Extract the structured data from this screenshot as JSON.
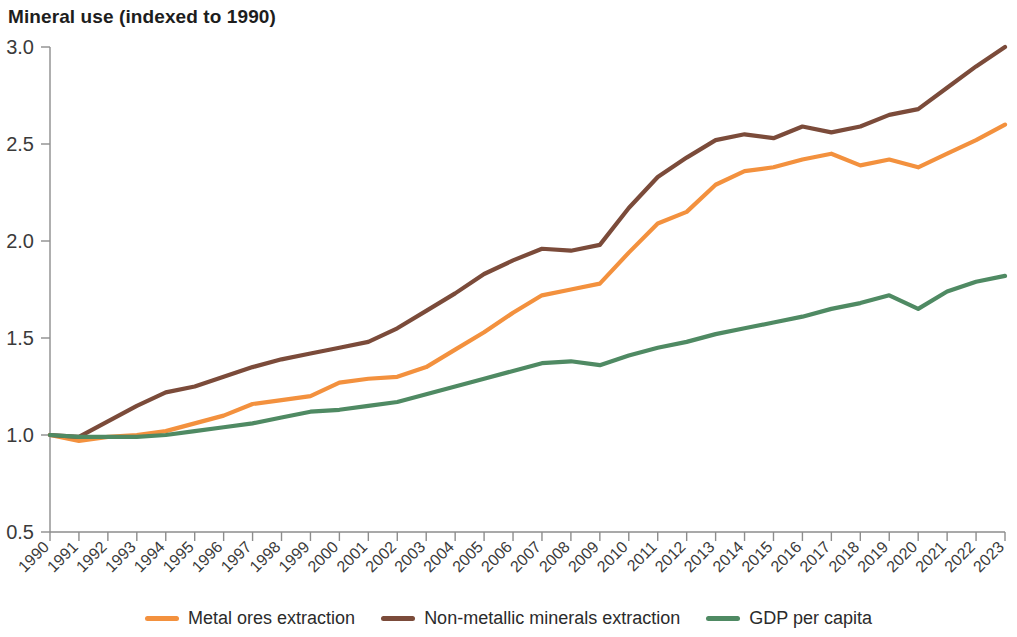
{
  "chart_data": {
    "type": "line",
    "title": "Mineral use (indexed to 1990)",
    "xlabel": "",
    "ylabel": "",
    "ylim": [
      0.5,
      3.0
    ],
    "yticks": [
      "0.5",
      "1.0",
      "1.5",
      "2.0",
      "2.5",
      "3.0"
    ],
    "ytick_values": [
      0.5,
      1.0,
      1.5,
      2.0,
      2.5,
      3.0
    ],
    "grid": false,
    "legend_position": "bottom",
    "categories": [
      "1990",
      "1991",
      "1992",
      "1993",
      "1994",
      "1995",
      "1996",
      "1997",
      "1998",
      "1999",
      "2000",
      "2001",
      "2002",
      "2003",
      "2004",
      "2005",
      "2006",
      "2007",
      "2008",
      "2009",
      "2010",
      "2011",
      "2012",
      "2013",
      "2014",
      "2015",
      "2016",
      "2017",
      "2018",
      "2019",
      "2020",
      "2021",
      "2022",
      "2023"
    ],
    "series": [
      {
        "name": "Metal ores extraction",
        "color": "#F3913E",
        "values": [
          1.0,
          0.97,
          0.99,
          1.0,
          1.02,
          1.06,
          1.1,
          1.16,
          1.18,
          1.2,
          1.27,
          1.29,
          1.3,
          1.35,
          1.44,
          1.53,
          1.63,
          1.72,
          1.75,
          1.78,
          1.94,
          2.09,
          2.15,
          2.29,
          2.36,
          2.38,
          2.42,
          2.45,
          2.39,
          2.42,
          2.38,
          2.45,
          2.52,
          2.6
        ]
      },
      {
        "name": "Non-metallic minerals extraction",
        "color": "#7B4B3A",
        "values": [
          1.0,
          0.99,
          1.07,
          1.15,
          1.22,
          1.25,
          1.3,
          1.35,
          1.39,
          1.42,
          1.45,
          1.48,
          1.55,
          1.64,
          1.73,
          1.83,
          1.9,
          1.96,
          1.95,
          1.98,
          2.17,
          2.33,
          2.43,
          2.52,
          2.55,
          2.53,
          2.59,
          2.56,
          2.59,
          2.65,
          2.68,
          2.79,
          2.9,
          3.0
        ]
      },
      {
        "name": "GDP per capita",
        "color": "#4F8A63",
        "values": [
          1.0,
          0.99,
          0.99,
          0.99,
          1.0,
          1.02,
          1.04,
          1.06,
          1.09,
          1.12,
          1.13,
          1.15,
          1.17,
          1.21,
          1.25,
          1.29,
          1.33,
          1.37,
          1.38,
          1.36,
          1.41,
          1.45,
          1.48,
          1.52,
          1.55,
          1.58,
          1.61,
          1.65,
          1.68,
          1.72,
          1.65,
          1.74,
          1.79,
          1.82
        ]
      }
    ]
  },
  "legend": {
    "items": [
      {
        "label": "Metal ores extraction",
        "color": "#F3913E"
      },
      {
        "label": "Non-metallic minerals extraction",
        "color": "#7B4B3A"
      },
      {
        "label": "GDP per capita",
        "color": "#4F8A63"
      }
    ]
  }
}
